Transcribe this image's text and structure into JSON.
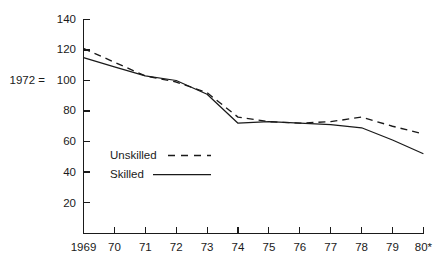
{
  "chart_data": {
    "type": "line",
    "title": "",
    "subtitle": "",
    "xlabel": "",
    "ylabel": "",
    "index_note": "1972 = 100",
    "x": [
      "1969",
      "70",
      "71",
      "72",
      "73",
      "74",
      "75",
      "76",
      "77",
      "78",
      "79",
      "80*"
    ],
    "xtick_labels": [
      "1969",
      "70",
      "71",
      "72",
      "73",
      "74",
      "75",
      "76",
      "77",
      "78",
      "79",
      "80*"
    ],
    "ytick_labels": [
      "20",
      "40",
      "60",
      "80",
      "100",
      "120",
      "140"
    ],
    "ytick_values": [
      20,
      40,
      60,
      80,
      100,
      120,
      140
    ],
    "ylim": [
      0,
      140
    ],
    "xlim": [
      0,
      11
    ],
    "grid": false,
    "legend_position": "inside-lower-left",
    "series": [
      {
        "name": "Unskilled",
        "style": "dashed",
        "color": "#1a1a1a",
        "values": [
          121,
          112,
          103,
          99,
          92,
          76,
          73,
          72,
          73,
          76,
          70,
          65
        ]
      },
      {
        "name": "Skilled",
        "style": "solid",
        "color": "#1a1a1a",
        "values": [
          115,
          109,
          103,
          100,
          91,
          72,
          73,
          72,
          71,
          69,
          61,
          52
        ]
      }
    ],
    "footnote_marker": "*"
  },
  "legend": {
    "items": [
      {
        "label": "Unskilled",
        "style": "dashed"
      },
      {
        "label": "Skilled",
        "style": "solid"
      }
    ]
  },
  "axes": {
    "y_axis_note": "1972 =",
    "y_axis_note_value": "100"
  }
}
